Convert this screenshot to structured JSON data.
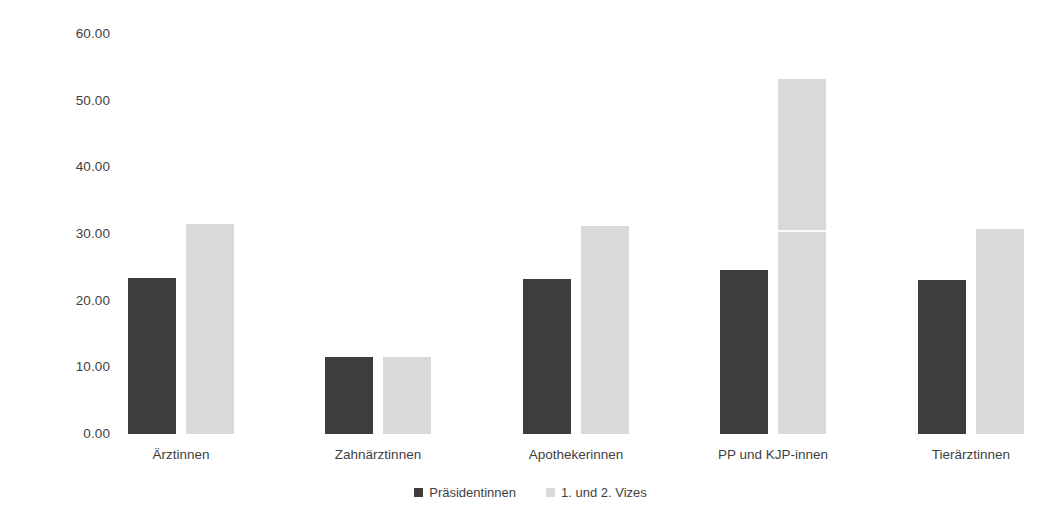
{
  "chart_data": {
    "type": "bar",
    "title": "",
    "subtitle": "",
    "xlabel": "",
    "ylabel": "",
    "categories": [
      "Ärztinnen",
      "Zahnärztinnen",
      "Apothekerinnen",
      "PP und KJP-innen",
      "Tierärztinnen"
    ],
    "series": [
      {
        "name": "Präsidentinnen",
        "color": "#3d3d3d",
        "values": [
          23.4,
          11.5,
          23.2,
          24.6,
          23.1
        ]
      },
      {
        "name": "1. und 2. Vizes",
        "color": "#d9d9d9",
        "values": [
          31.5,
          11.5,
          31.2,
          53.2,
          30.8
        ]
      }
    ],
    "ylim": [
      0,
      60
    ],
    "ytick_values": [
      0,
      10,
      20,
      30,
      40,
      50,
      60
    ],
    "ytick_labels": [
      "0.00",
      "10.00",
      "20.00",
      "30.00",
      "40.00",
      "50.00",
      "60.00"
    ],
    "grid": false,
    "legend_position": "bottom",
    "background_color": "#ffffff",
    "text_color": "#3f3f3f"
  }
}
